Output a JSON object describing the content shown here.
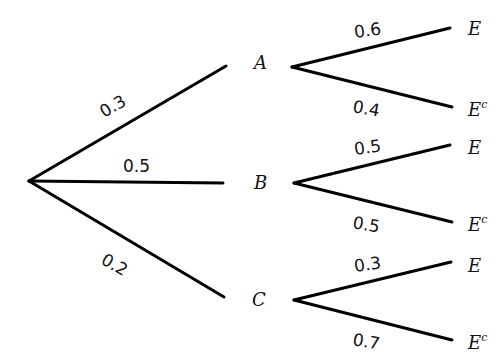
{
  "diagram": {
    "type": "probability-tree",
    "root": {
      "x": 29,
      "y": 181
    },
    "first_level": [
      {
        "label": "A",
        "probability": "0.3",
        "end": {
          "x": 226,
          "y": 66
        },
        "label_pos": {
          "x": 254,
          "y": 69
        },
        "prob_pos": {
          "x": 104,
          "y": 118,
          "rotate": -30
        }
      },
      {
        "label": "B",
        "probability": "0.5",
        "end": {
          "x": 223,
          "y": 183
        },
        "label_pos": {
          "x": 254,
          "y": 189
        },
        "prob_pos": {
          "x": 123,
          "y": 172,
          "rotate": 0
        }
      },
      {
        "label": "C",
        "probability": "0.2",
        "end": {
          "x": 224,
          "y": 297
        },
        "label_pos": {
          "x": 252,
          "y": 306
        },
        "prob_pos": {
          "x": 100,
          "y": 263,
          "rotate": 30
        }
      }
    ],
    "second_level": [
      {
        "parent": "A",
        "start": {
          "x": 292,
          "y": 67
        },
        "outcomes": [
          {
            "label": "E",
            "superscript": "",
            "probability": "0.6",
            "end": {
              "x": 450,
              "y": 28
            },
            "label_pos": {
              "x": 468,
              "y": 35
            },
            "prob_pos": {
              "x": 355,
              "y": 38,
              "rotate": -8
            }
          },
          {
            "label": "E",
            "superscript": "c",
            "probability": "0.4",
            "end": {
              "x": 452,
              "y": 107
            },
            "label_pos": {
              "x": 468,
              "y": 116
            },
            "prob_pos": {
              "x": 352,
              "y": 112,
              "rotate": 10
            }
          }
        ]
      },
      {
        "parent": "B",
        "start": {
          "x": 294,
          "y": 183
        },
        "outcomes": [
          {
            "label": "E",
            "superscript": "",
            "probability": "0.5",
            "end": {
              "x": 450,
              "y": 145
            },
            "label_pos": {
              "x": 468,
              "y": 154
            },
            "prob_pos": {
              "x": 355,
              "y": 155,
              "rotate": -8
            }
          },
          {
            "label": "E",
            "superscript": "c",
            "probability": "0.5",
            "end": {
              "x": 452,
              "y": 222
            },
            "label_pos": {
              "x": 468,
              "y": 231
            },
            "prob_pos": {
              "x": 352,
              "y": 228,
              "rotate": 10
            }
          }
        ]
      },
      {
        "parent": "C",
        "start": {
          "x": 294,
          "y": 300
        },
        "outcomes": [
          {
            "label": "E",
            "superscript": "",
            "probability": "0.3",
            "end": {
              "x": 451,
              "y": 262
            },
            "label_pos": {
              "x": 468,
              "y": 272
            },
            "prob_pos": {
              "x": 355,
              "y": 272,
              "rotate": -8
            }
          },
          {
            "label": "E",
            "superscript": "c",
            "probability": "0.7",
            "end": {
              "x": 452,
              "y": 340
            },
            "label_pos": {
              "x": 468,
              "y": 349
            },
            "prob_pos": {
              "x": 352,
              "y": 345,
              "rotate": 10
            }
          }
        ]
      }
    ]
  },
  "colors": {
    "line": "#000000",
    "text": "#111111",
    "background": "#ffffff"
  }
}
